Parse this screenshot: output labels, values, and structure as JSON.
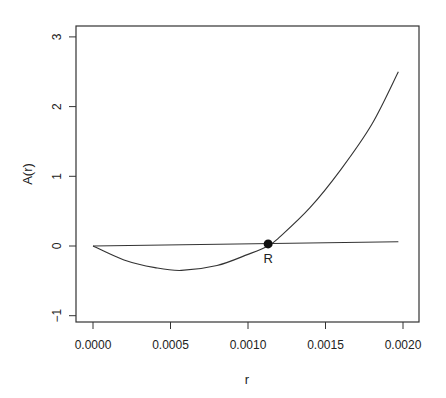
{
  "chart_data": {
    "type": "line",
    "title": "",
    "xlabel": "r",
    "ylabel": "A(r)",
    "xlim": [
      -5e-05,
      0.0021
    ],
    "ylim": [
      -1.15,
      3.15
    ],
    "x_ticks": [
      "0.0000",
      "0.0005",
      "0.0010",
      "0.0015",
      "0.0020"
    ],
    "y_ticks": [
      "-1",
      "0",
      "1",
      "2",
      "3"
    ],
    "grid": false,
    "legend": null,
    "series": [
      {
        "name": "A(r) curve",
        "x": [
          0.0,
          0.0002,
          0.0004,
          0.00057,
          0.0008,
          0.001,
          0.00113,
          0.0012,
          0.0014,
          0.0016,
          0.0018,
          0.00197
        ],
        "y": [
          0.0,
          -0.2,
          -0.31,
          -0.35,
          -0.28,
          -0.12,
          0.0,
          0.12,
          0.55,
          1.1,
          1.75,
          2.5
        ]
      },
      {
        "name": "reference line",
        "x": [
          0.0,
          0.00197
        ],
        "y": [
          0.0,
          0.06
        ]
      }
    ],
    "annotations": [
      {
        "label": "R",
        "x": 0.00113,
        "y": 0.03,
        "marker": "filled-circle"
      }
    ]
  }
}
